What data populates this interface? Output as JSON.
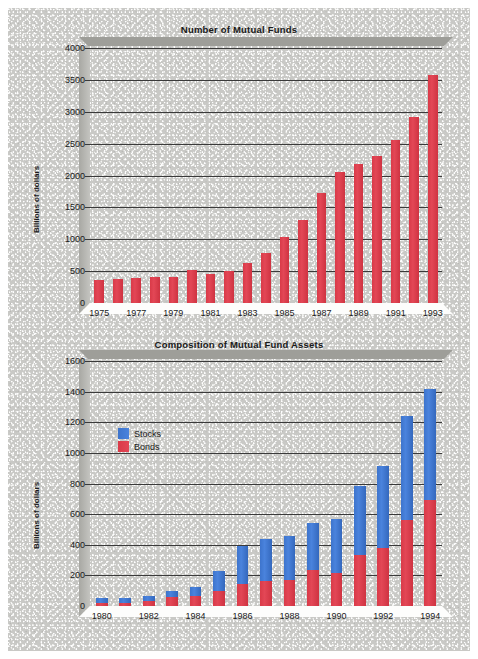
{
  "figure": {
    "background_color": "#c9c9c6",
    "bar_red": "#d93a48",
    "bar_blue": "#3d74cc"
  },
  "chart_data": [
    {
      "type": "bar",
      "title": "Number of Mutual Funds",
      "xlabel": "",
      "ylabel": "Billions of dollars",
      "ylim": [
        0,
        4000
      ],
      "yticks": [
        0,
        500,
        1000,
        1500,
        2000,
        2500,
        3000,
        3500,
        4000
      ],
      "grid": true,
      "legend": "none",
      "categories": [
        "1975",
        "1976",
        "1977",
        "1978",
        "1979",
        "1980",
        "1981",
        "1982",
        "1983",
        "1984",
        "1985",
        "1986",
        "1987",
        "1988",
        "1989",
        "1990",
        "1991",
        "1992",
        "1993"
      ],
      "tick_labels": [
        "1975",
        "1977",
        "1979",
        "1981",
        "1983",
        "1985",
        "1987",
        "1989",
        "1991",
        "1993"
      ],
      "values": [
        360,
        370,
        390,
        410,
        410,
        520,
        450,
        500,
        620,
        790,
        1030,
        1300,
        1720,
        2060,
        2180,
        2300,
        2550,
        2920,
        3570
      ],
      "series_color": "#d93a48"
    },
    {
      "type": "bar",
      "subtype": "stacked",
      "title": "Composition of Mutual Fund Assets",
      "xlabel": "",
      "ylabel": "Billions of dollars",
      "ylim": [
        0,
        1600
      ],
      "yticks": [
        0,
        200,
        400,
        600,
        800,
        1000,
        1200,
        1400,
        1600
      ],
      "grid": true,
      "legend": "inside-upper-left",
      "categories": [
        "1980",
        "1981",
        "1982",
        "1983",
        "1984",
        "1985",
        "1986",
        "1987",
        "1988",
        "1989",
        "1990",
        "1991",
        "1992",
        "1993",
        "1994"
      ],
      "tick_labels": [
        "1980",
        "1982",
        "1984",
        "1986",
        "1988",
        "1990",
        "1992",
        "1994"
      ],
      "series": [
        {
          "name": "Bonds",
          "color": "#d93a48",
          "values": [
            20,
            22,
            34,
            58,
            66,
            100,
            143,
            165,
            170,
            233,
            213,
            332,
            377,
            560,
            695
          ]
        },
        {
          "name": "Stocks",
          "color": "#3d74cc",
          "values": [
            35,
            28,
            33,
            43,
            60,
            127,
            250,
            272,
            288,
            310,
            357,
            450,
            535,
            680,
            725
          ]
        }
      ],
      "totals": [
        55,
        50,
        67,
        101,
        126,
        227,
        393,
        437,
        458,
        543,
        570,
        782,
        912,
        1240,
        1420
      ]
    }
  ]
}
